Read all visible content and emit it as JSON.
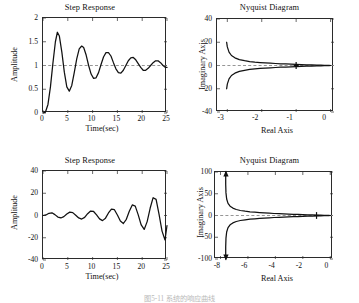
{
  "figure": {
    "caption": "图5-11 系统的响应曲线",
    "background": "#ffffff",
    "line_color": "#111111",
    "axis_color": "#2b2b2b",
    "reference_line_color": "#8a8a8a"
  },
  "panels": {
    "top_left": {
      "title": "Step Response",
      "xlabel": "Time(sec)",
      "ylabel": "Amplitude",
      "xticks": [
        "0",
        "5",
        "10",
        "15",
        "20",
        "25"
      ],
      "yticks": [
        "0",
        "0.5",
        "1",
        "1.5",
        "2"
      ]
    },
    "top_right": {
      "title": "Nyquist Diagram",
      "xlabel": "Real Axis",
      "ylabel": "Imaginary Axis",
      "xticks": [
        "-3",
        "-2",
        "-1",
        "0"
      ],
      "yticks": [
        "-40",
        "-20",
        "0",
        "20",
        "40"
      ]
    },
    "bottom_left": {
      "title": "Step Response",
      "xlabel": "Time(sec)",
      "ylabel": "Amplitude",
      "xticks": [
        "0",
        "5",
        "10",
        "15",
        "20",
        "25"
      ],
      "yticks": [
        "-40",
        "-20",
        "0",
        "20",
        "40"
      ]
    },
    "bottom_right": {
      "title": "Nyquist Diagram",
      "xlabel": "Real Axis",
      "ylabel": "Imaginary Axis",
      "xticks": [
        "-8",
        "-6",
        "-4",
        "-2",
        "0"
      ],
      "yticks": [
        "-100",
        "-50",
        "0",
        "50",
        "100"
      ]
    }
  },
  "chart_data": [
    {
      "id": "top_left",
      "type": "line",
      "title": "Step Response",
      "xlabel": "Time(sec)",
      "ylabel": "Amplitude",
      "xlim": [
        0,
        25
      ],
      "ylim": [
        0,
        2
      ],
      "xticks": [
        0,
        5,
        10,
        15,
        20,
        25
      ],
      "yticks": [
        0,
        0.5,
        1,
        1.5,
        2
      ],
      "grid": false,
      "legend": null,
      "annotations": [
        {
          "type": "hline",
          "y": 1,
          "style": "dashed",
          "label": "steady-state reference"
        }
      ],
      "series": [
        {
          "name": "step response (damped oscillation)",
          "x": [
            0,
            0.5,
            1.0,
            1.5,
            2.0,
            2.5,
            2.9,
            3.3,
            3.8,
            4.3,
            4.8,
            5.3,
            5.8,
            6.3,
            6.8,
            7.3,
            7.8,
            8.2,
            8.7,
            9.2,
            9.7,
            10.2,
            10.7,
            11.2,
            11.7,
            12.2,
            12.7,
            13.2,
            13.7,
            14.2,
            14.7,
            15.2,
            15.7,
            16.2,
            16.7,
            17.2,
            17.7,
            18.2,
            18.7,
            19.2,
            19.7,
            20.2,
            20.7,
            21.2,
            21.7,
            22.2,
            22.7,
            23.2,
            23.7,
            24.2,
            24.7,
            25
          ],
          "y": [
            0.0,
            0.02,
            0.18,
            0.55,
            1.05,
            1.5,
            1.7,
            1.62,
            1.28,
            0.86,
            0.55,
            0.46,
            0.58,
            0.85,
            1.14,
            1.35,
            1.41,
            1.38,
            1.22,
            1.0,
            0.82,
            0.73,
            0.74,
            0.85,
            1.02,
            1.18,
            1.27,
            1.27,
            1.2,
            1.06,
            0.93,
            0.85,
            0.84,
            0.9,
            1.0,
            1.1,
            1.16,
            1.17,
            1.12,
            1.04,
            0.96,
            0.9,
            0.9,
            0.94,
            1.0,
            1.06,
            1.1,
            1.1,
            1.06,
            1.0,
            0.96,
            0.96
          ]
        }
      ]
    },
    {
      "id": "top_right",
      "type": "line",
      "title": "Nyquist Diagram",
      "xlabel": "Real Axis",
      "ylabel": "Imaginary Axis",
      "xlim": [
        -3.3,
        0.1
      ],
      "ylim": [
        -40,
        40
      ],
      "xticks": [
        -3,
        -2,
        -1,
        0
      ],
      "yticks": [
        -40,
        -20,
        0,
        20,
        40
      ],
      "grid": false,
      "legend": null,
      "annotations": [
        {
          "type": "hline",
          "y": 0,
          "style": "dashed",
          "label": "real axis"
        },
        {
          "type": "marker",
          "x": -1,
          "y": 0,
          "style": "cross",
          "label": "critical point -1"
        }
      ],
      "series": [
        {
          "name": "nyquist upper branch",
          "x": [
            -3.02,
            -3.0,
            -2.95,
            -2.88,
            -2.78,
            -2.65,
            -2.5,
            -2.35,
            -2.2,
            -2.05,
            -1.9,
            -1.75,
            -1.6,
            -1.45,
            -1.3,
            -1.15,
            -1.0,
            -0.85,
            -0.7,
            -0.55,
            -0.4,
            -0.28,
            -0.18,
            -0.1,
            -0.04,
            0.0
          ],
          "y": [
            20.0,
            16.0,
            11.5,
            8.6,
            6.6,
            5.1,
            4.1,
            3.4,
            2.9,
            2.5,
            2.2,
            1.95,
            1.72,
            1.5,
            1.3,
            1.12,
            0.95,
            0.8,
            0.64,
            0.5,
            0.36,
            0.25,
            0.16,
            0.09,
            0.03,
            0.0
          ]
        },
        {
          "name": "nyquist lower branch",
          "x": [
            -3.02,
            -3.0,
            -2.95,
            -2.88,
            -2.78,
            -2.65,
            -2.5,
            -2.35,
            -2.2,
            -2.05,
            -1.9,
            -1.75,
            -1.6,
            -1.45,
            -1.3,
            -1.15,
            -1.0,
            -0.85,
            -0.7,
            -0.55,
            -0.4,
            -0.28,
            -0.18,
            -0.1,
            -0.04,
            0.0
          ],
          "y": [
            -20.0,
            -16.0,
            -11.5,
            -8.6,
            -6.6,
            -5.1,
            -4.1,
            -3.4,
            -2.9,
            -2.5,
            -2.2,
            -1.95,
            -1.72,
            -1.5,
            -1.3,
            -1.12,
            -0.95,
            -0.8,
            -0.64,
            -0.5,
            -0.36,
            -0.25,
            -0.16,
            -0.09,
            -0.03,
            0.0
          ]
        }
      ]
    },
    {
      "id": "bottom_left",
      "type": "line",
      "title": "Step Response",
      "xlabel": "Time(sec)",
      "ylabel": "Amplitude",
      "xlim": [
        0,
        25
      ],
      "ylim": [
        -40,
        40
      ],
      "xticks": [
        0,
        5,
        10,
        15,
        20,
        25
      ],
      "yticks": [
        -40,
        -20,
        0,
        20,
        40
      ],
      "grid": false,
      "legend": null,
      "annotations": [],
      "series": [
        {
          "name": "step response (growing oscillation)",
          "x": [
            0,
            0.6,
            1.2,
            1.8,
            2.4,
            3.0,
            3.6,
            4.2,
            4.8,
            5.4,
            6.0,
            6.6,
            7.2,
            7.8,
            8.4,
            9.0,
            9.6,
            10.2,
            10.8,
            11.4,
            12.0,
            12.6,
            13.2,
            13.8,
            14.4,
            15.0,
            15.6,
            16.2,
            16.8,
            17.4,
            18.0,
            18.6,
            19.2,
            19.8,
            20.4,
            21.0,
            21.6,
            22.2,
            22.8,
            23.4,
            24.0,
            24.6,
            25.0
          ],
          "y": [
            0,
            0.5,
            2.0,
            2.4,
            0.8,
            -1.4,
            -2.2,
            -1.0,
            1.4,
            3.0,
            2.6,
            0.3,
            -2.2,
            -3.2,
            -1.7,
            1.6,
            4.0,
            3.6,
            0.5,
            -3.0,
            -4.6,
            -2.4,
            2.3,
            5.8,
            5.2,
            0.5,
            -5.0,
            -7.2,
            -3.4,
            3.8,
            9.5,
            8.4,
            0.6,
            -8.5,
            -12.5,
            -5.5,
            6.5,
            16.0,
            14.5,
            1.0,
            -14.0,
            -22.0,
            -9.0
          ]
        }
      ]
    },
    {
      "id": "bottom_right",
      "type": "line",
      "title": "Nyquist Diagram",
      "xlabel": "Real Axis",
      "ylabel": "Imaginary Axis",
      "xlim": [
        -8.4,
        0.2
      ],
      "ylim": [
        -100,
        100
      ],
      "xticks": [
        -8,
        -6,
        -4,
        -2,
        0
      ],
      "yticks": [
        -100,
        -50,
        0,
        50,
        100
      ],
      "grid": false,
      "legend": null,
      "annotations": [
        {
          "type": "hline",
          "y": 0,
          "style": "dashed",
          "label": "real axis"
        },
        {
          "type": "marker",
          "x": -1,
          "y": 0,
          "style": "cross",
          "label": "critical point -1"
        },
        {
          "type": "arrow",
          "x": -7.6,
          "y": 93,
          "direction": "up",
          "label": "direction of increasing frequency"
        },
        {
          "type": "arrow",
          "x": -7.6,
          "y": -93,
          "direction": "down",
          "label": "direction of increasing frequency"
        }
      ],
      "series": [
        {
          "name": "nyquist upper branch",
          "x": [
            -7.62,
            -7.62,
            -7.6,
            -7.55,
            -7.45,
            -7.3,
            -7.1,
            -6.85,
            -6.55,
            -6.2,
            -5.85,
            -5.5,
            -5.15,
            -4.8,
            -4.45,
            -4.1,
            -3.75,
            -3.4,
            -3.05,
            -2.7,
            -2.35,
            -2.0,
            -1.65,
            -1.3,
            -1.0,
            -0.7,
            -0.45,
            -0.25,
            -0.1,
            0.0
          ],
          "y": [
            100,
            72,
            52,
            38,
            28,
            21.5,
            17,
            13.8,
            11.5,
            9.8,
            8.5,
            7.5,
            6.6,
            5.9,
            5.2,
            4.6,
            4.1,
            3.6,
            3.2,
            2.8,
            2.4,
            2.0,
            1.65,
            1.3,
            1.0,
            0.7,
            0.45,
            0.25,
            0.1,
            0.0
          ]
        },
        {
          "name": "nyquist lower branch",
          "x": [
            -7.62,
            -7.62,
            -7.6,
            -7.55,
            -7.45,
            -7.3,
            -7.1,
            -6.85,
            -6.55,
            -6.2,
            -5.85,
            -5.5,
            -5.15,
            -4.8,
            -4.45,
            -4.1,
            -3.75,
            -3.4,
            -3.05,
            -2.7,
            -2.35,
            -2.0,
            -1.65,
            -1.3,
            -1.0,
            -0.7,
            -0.45,
            -0.25,
            -0.1,
            0.0
          ],
          "y": [
            -100,
            -72,
            -52,
            -38,
            -28,
            -21.5,
            -17,
            -13.8,
            -11.5,
            -9.8,
            -8.5,
            -7.5,
            -6.6,
            -5.9,
            -5.2,
            -4.6,
            -4.1,
            -3.6,
            -3.2,
            -2.8,
            -2.4,
            -2.0,
            -1.65,
            -1.3,
            -1.0,
            -0.7,
            -0.45,
            -0.25,
            -0.1,
            0.0
          ]
        }
      ]
    }
  ]
}
